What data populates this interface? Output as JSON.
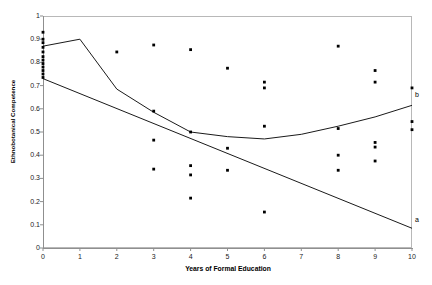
{
  "chart_data": {
    "type": "scatter",
    "title": "",
    "xlabel": "Years of Formal Education",
    "ylabel": "Ethnobotanical Competence",
    "xlim": [
      0,
      10
    ],
    "ylim": [
      0,
      1
    ],
    "grid": false,
    "legend_position": "inline-right",
    "xticks": [
      "0",
      "1",
      "2",
      "3",
      "4",
      "5",
      "6",
      "7",
      "8",
      "9",
      "10"
    ],
    "yticks": [
      "0",
      "0.1",
      "0.2",
      "0.3",
      "0.4",
      "0.5",
      "0.6",
      "0.7",
      "0.8",
      "0.9",
      "1"
    ],
    "marker_color": "#000000",
    "line_color": "#1a1a1a",
    "frame_color": "#b8b8b8",
    "points": [
      {
        "x": 0,
        "y": 0.93
      },
      {
        "x": 0,
        "y": 0.9
      },
      {
        "x": 0,
        "y": 0.885
      },
      {
        "x": 0,
        "y": 0.865
      },
      {
        "x": 0,
        "y": 0.845
      },
      {
        "x": 0,
        "y": 0.825
      },
      {
        "x": 0,
        "y": 0.81
      },
      {
        "x": 0,
        "y": 0.795
      },
      {
        "x": 0,
        "y": 0.78
      },
      {
        "x": 0,
        "y": 0.765
      },
      {
        "x": 0,
        "y": 0.75
      },
      {
        "x": 0,
        "y": 0.735
      },
      {
        "x": 2,
        "y": 0.845
      },
      {
        "x": 3,
        "y": 0.875
      },
      {
        "x": 3,
        "y": 0.59
      },
      {
        "x": 3,
        "y": 0.465
      },
      {
        "x": 3,
        "y": 0.34
      },
      {
        "x": 4,
        "y": 0.855
      },
      {
        "x": 4,
        "y": 0.5
      },
      {
        "x": 4,
        "y": 0.355
      },
      {
        "x": 4,
        "y": 0.315
      },
      {
        "x": 4,
        "y": 0.215
      },
      {
        "x": 5,
        "y": 0.775
      },
      {
        "x": 5,
        "y": 0.43
      },
      {
        "x": 5,
        "y": 0.335
      },
      {
        "x": 6,
        "y": 0.715
      },
      {
        "x": 6,
        "y": 0.69
      },
      {
        "x": 6,
        "y": 0.525
      },
      {
        "x": 6,
        "y": 0.155
      },
      {
        "x": 8,
        "y": 0.87
      },
      {
        "x": 8,
        "y": 0.515
      },
      {
        "x": 8,
        "y": 0.4
      },
      {
        "x": 8,
        "y": 0.335
      },
      {
        "x": 9,
        "y": 0.765
      },
      {
        "x": 9,
        "y": 0.715
      },
      {
        "x": 9,
        "y": 0.455
      },
      {
        "x": 9,
        "y": 0.435
      },
      {
        "x": 9,
        "y": 0.375
      },
      {
        "x": 10,
        "y": 0.69
      },
      {
        "x": 10,
        "y": 0.545
      },
      {
        "x": 10,
        "y": 0.51
      }
    ],
    "series": [
      {
        "name": "b",
        "label": "b",
        "kind": "line",
        "x": [
          0,
          1,
          2,
          3,
          4,
          5,
          6,
          7,
          8,
          9,
          10
        ],
        "values": [
          0.87,
          0.9,
          0.685,
          0.585,
          0.5,
          0.48,
          0.47,
          0.49,
          0.525,
          0.565,
          0.615
        ]
      },
      {
        "name": "a",
        "label": "a",
        "kind": "line",
        "x": [
          0,
          10
        ],
        "values": [
          0.73,
          0.085
        ]
      }
    ]
  }
}
